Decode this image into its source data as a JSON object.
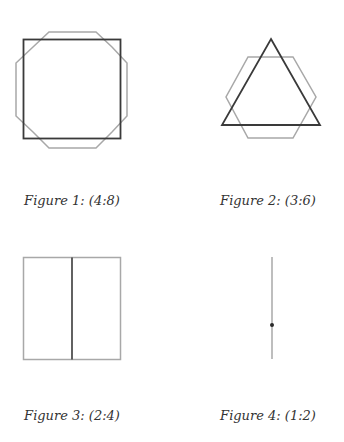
{
  "colors": {
    "dark_stroke": "#3a3a3a",
    "light_stroke": "#a8a8a8",
    "background": "#ffffff"
  },
  "figures": [
    {
      "caption": "Figure 1: (4:8)",
      "shapes": [
        "square",
        "octagon"
      ],
      "ratio": "4:8"
    },
    {
      "caption": "Figure 2: (3:6)",
      "shapes": [
        "triangle",
        "hexagon"
      ],
      "ratio": "3:6"
    },
    {
      "caption": "Figure 3: (2:4)",
      "shapes": [
        "line-segment-vertical",
        "square"
      ],
      "ratio": "2:4"
    },
    {
      "caption": "Figure 4: (1:2)",
      "shapes": [
        "point",
        "line-segment"
      ],
      "ratio": "1:2"
    }
  ]
}
